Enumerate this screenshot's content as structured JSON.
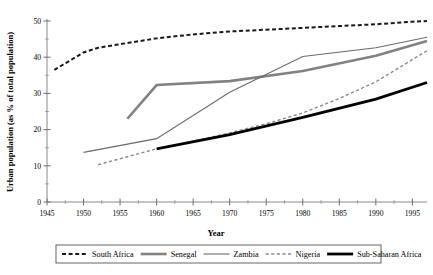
{
  "chart_data": {
    "type": "line",
    "title": "",
    "xlabel": "Year",
    "ylabel": "Urban population (as % of total population)",
    "xlim": [
      1945,
      1997
    ],
    "ylim": [
      0,
      50
    ],
    "grid": false,
    "legend_position": "bottom",
    "xticks": [
      1945,
      1950,
      1955,
      1960,
      1965,
      1970,
      1975,
      1980,
      1985,
      1990,
      1995
    ],
    "xtick_labels": [
      "1945",
      "1950",
      "1955",
      "1960",
      "1965",
      "1970",
      "1975",
      "1980",
      "1985",
      "1990",
      "1995"
    ],
    "xminor_ticks": [
      1947.5,
      1952.5,
      1957.5,
      1962.5,
      1967.5,
      1972.5,
      1977.5,
      1982.5,
      1987.5,
      1992.5
    ],
    "yticks": [
      0,
      10,
      20,
      30,
      40,
      50
    ],
    "ytick_labels": [
      "0",
      "10",
      "20",
      "30",
      "40",
      "50"
    ],
    "yminor_ticks": [
      5,
      15,
      25,
      35,
      45
    ],
    "series": [
      {
        "name": "South Africa",
        "color": "#1a1a1a",
        "style": "dashed",
        "width": 2.0,
        "dash": "4,2.6",
        "x": [
          1946,
          1950,
          1952,
          1955,
          1960,
          1965,
          1970,
          1975,
          1980,
          1985,
          1990,
          1995,
          1997
        ],
        "values": [
          36.5,
          41.3,
          42.6,
          43.6,
          45.2,
          46.3,
          47.1,
          47.6,
          48.1,
          48.6,
          49.1,
          49.8,
          50.0
        ]
      },
      {
        "name": "Senegal",
        "color": "#828282",
        "style": "solid",
        "width": 2.6,
        "dash": "",
        "x": [
          1956,
          1960,
          1970,
          1980,
          1990,
          1997
        ],
        "values": [
          23.0,
          32.3,
          33.4,
          36.2,
          40.4,
          44.5
        ]
      },
      {
        "name": "Zambia",
        "color": "#6b6b6b",
        "style": "solid",
        "width": 1.1,
        "dash": "",
        "x": [
          1950,
          1960,
          1970,
          1980,
          1990,
          1997
        ],
        "values": [
          13.7,
          17.5,
          30.3,
          40.2,
          42.6,
          45.5
        ]
      },
      {
        "name": "Nigeria",
        "color": "#8c8c8c",
        "style": "dashed",
        "width": 1.4,
        "dash": "3.2,2.4",
        "x": [
          1952,
          1960,
          1965,
          1970,
          1975,
          1980,
          1985,
          1990,
          1997
        ],
        "values": [
          10.3,
          14.7,
          16.8,
          19.1,
          21.6,
          24.6,
          28.6,
          33.2,
          41.8
        ]
      },
      {
        "name": "Sub-Saharan Africa",
        "color": "#000000",
        "style": "solid",
        "width": 2.8,
        "dash": "",
        "x": [
          1960,
          1970,
          1980,
          1990,
          1997
        ],
        "values": [
          14.7,
          18.6,
          23.4,
          28.4,
          33.0
        ]
      }
    ]
  },
  "legend": {
    "entries": [
      {
        "label": "South Africa"
      },
      {
        "label": "Senegal"
      },
      {
        "label": "Zambia"
      },
      {
        "label": "Nigeria"
      },
      {
        "label": "Sub-Saharan Africa"
      }
    ]
  }
}
